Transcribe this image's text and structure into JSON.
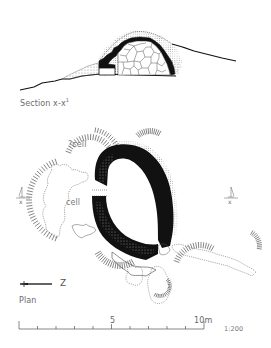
{
  "figure": {
    "section": {
      "caption": "Section x-x",
      "caption_superscript": "1"
    },
    "plan": {
      "caption": "Plan",
      "cell_labels": [
        "?cell",
        "cell"
      ],
      "section_markers": [
        "x",
        "x"
      ],
      "north_arrow_letter": "Z"
    },
    "scale_bar": {
      "labels": [
        "5",
        "10m"
      ],
      "ratio": "1:200",
      "min": 0,
      "max": 10,
      "unit": "m",
      "ticks": [
        0,
        1,
        2,
        3,
        4,
        5,
        6,
        7,
        8,
        9,
        10
      ]
    },
    "colors": {
      "ink": "#111111",
      "stipple": "#9a9a9a",
      "text": "#6a6a6a"
    }
  }
}
